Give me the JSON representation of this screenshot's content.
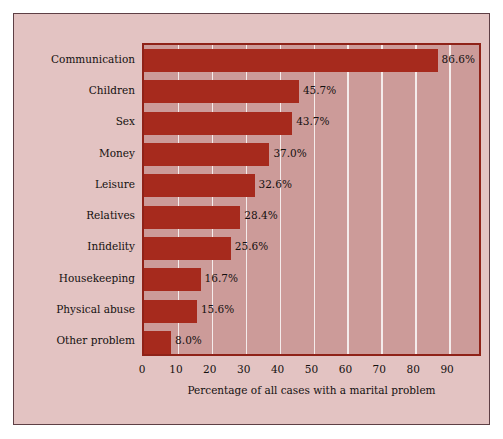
{
  "chart_data": {
    "type": "bar",
    "orientation": "horizontal",
    "title": "",
    "xlabel": "Percentage of all cases with a marital problem",
    "ylabel": "",
    "categories": [
      "Communication",
      "Children",
      "Sex",
      "Money",
      "Leisure",
      "Relatives",
      "Infidelity",
      "Housekeeping",
      "Physical abuse",
      "Other problem"
    ],
    "values": [
      86.6,
      45.7,
      43.7,
      37.0,
      32.6,
      28.4,
      25.6,
      16.7,
      15.6,
      8.0
    ],
    "data_labels": [
      "86.6%",
      "45.7%",
      "43.7%",
      "37.0%",
      "32.6%",
      "28.4%",
      "25.6%",
      "16.7%",
      "15.6%",
      "8.0%"
    ],
    "xlim": [
      0,
      100
    ],
    "xticks": [
      0,
      10,
      20,
      30,
      40,
      50,
      60,
      70,
      80,
      90
    ],
    "xtick_labels": [
      "0",
      "10",
      "20",
      "30",
      "40",
      "50",
      "60",
      "70",
      "80",
      "90"
    ],
    "grid": true,
    "grid_axis": "x",
    "legend": false,
    "colors": {
      "bar_fill": "#a62a1d",
      "plot_background": "#cc9b99",
      "panel_background": "#e3c3c2",
      "gridline": "#f4eceb",
      "plot_border": "#8f2218",
      "panel_border": "#5e3f45",
      "text": "#14100f"
    }
  }
}
